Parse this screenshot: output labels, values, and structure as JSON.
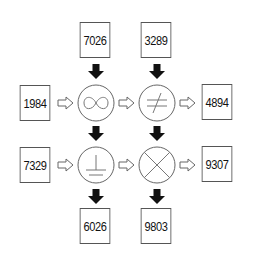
{
  "diagram": {
    "inputs_top": [
      {
        "id": "top-left",
        "value": "7026"
      },
      {
        "id": "top-right",
        "value": "3289"
      }
    ],
    "inputs_left": [
      {
        "id": "left-top",
        "value": "1984"
      },
      {
        "id": "left-bottom",
        "value": "7329"
      }
    ],
    "outputs_right": [
      {
        "id": "right-top",
        "value": "4894"
      },
      {
        "id": "right-bottom",
        "value": "9307"
      }
    ],
    "outputs_bottom": [
      {
        "id": "bottom-left",
        "value": "6026"
      },
      {
        "id": "bottom-right",
        "value": "9803"
      }
    ],
    "operators": [
      {
        "position": "top-left",
        "symbol": "infinity-icon",
        "glyph": "∞"
      },
      {
        "position": "top-right",
        "symbol": "not-equal-icon",
        "glyph": "≠"
      },
      {
        "position": "bottom-left",
        "symbol": "perpendicular-icon",
        "glyph": "⊥"
      },
      {
        "position": "bottom-right",
        "symbol": "circled-x-icon",
        "glyph": "⊗"
      }
    ],
    "arrows": {
      "horizontal": "hollow-right-arrow",
      "vertical": "solid-down-arrow"
    },
    "colors": {
      "stroke": "#555555",
      "arrow_fill": "#111111",
      "text": "#111111"
    }
  }
}
